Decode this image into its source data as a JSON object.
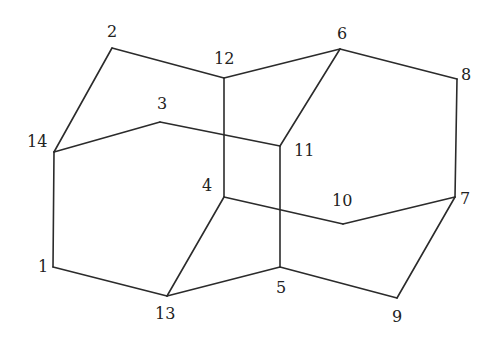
{
  "diagram": {
    "type": "graph",
    "directed": false,
    "colors": {
      "background": "#ffffff",
      "edge": "#2b2b2b",
      "label": "#222222"
    },
    "vertices": [
      {
        "id": "1",
        "label": "1",
        "x": 53,
        "y": 267,
        "label_x": 38,
        "label_y": 272
      },
      {
        "id": "2",
        "label": "2",
        "x": 112,
        "y": 48,
        "label_x": 107,
        "label_y": 37
      },
      {
        "id": "3",
        "label": "3",
        "x": 160,
        "y": 122,
        "label_x": 157,
        "label_y": 109
      },
      {
        "id": "4",
        "label": "4",
        "x": 224,
        "y": 197,
        "label_x": 202,
        "label_y": 191
      },
      {
        "id": "5",
        "label": "5",
        "x": 280,
        "y": 267,
        "label_x": 276,
        "label_y": 293
      },
      {
        "id": "6",
        "label": "6",
        "x": 340,
        "y": 49,
        "label_x": 337,
        "label_y": 39
      },
      {
        "id": "7",
        "label": "7",
        "x": 455,
        "y": 197,
        "label_x": 460,
        "label_y": 204
      },
      {
        "id": "8",
        "label": "8",
        "x": 457,
        "y": 79,
        "label_x": 461,
        "label_y": 80
      },
      {
        "id": "9",
        "label": "9",
        "x": 397,
        "y": 298,
        "label_x": 392,
        "label_y": 322
      },
      {
        "id": "10",
        "label": "10",
        "x": 343,
        "y": 224,
        "label_x": 332,
        "label_y": 206
      },
      {
        "id": "11",
        "label": "11",
        "x": 280,
        "y": 146,
        "label_x": 294,
        "label_y": 156
      },
      {
        "id": "12",
        "label": "12",
        "x": 224,
        "y": 78,
        "label_x": 214,
        "label_y": 64
      },
      {
        "id": "13",
        "label": "13",
        "x": 167,
        "y": 296,
        "label_x": 155,
        "label_y": 319
      },
      {
        "id": "14",
        "label": "14",
        "x": 54,
        "y": 152,
        "label_x": 27,
        "label_y": 147
      }
    ],
    "edges": [
      [
        "2",
        "14"
      ],
      [
        "2",
        "12"
      ],
      [
        "12",
        "6"
      ],
      [
        "12",
        "4"
      ],
      [
        "14",
        "3"
      ],
      [
        "3",
        "11"
      ],
      [
        "14",
        "1"
      ],
      [
        "1",
        "13"
      ],
      [
        "13",
        "4"
      ],
      [
        "13",
        "5"
      ],
      [
        "4",
        "10"
      ],
      [
        "10",
        "7"
      ],
      [
        "6",
        "11"
      ],
      [
        "6",
        "8"
      ],
      [
        "8",
        "7"
      ],
      [
        "7",
        "9"
      ],
      [
        "9",
        "5"
      ],
      [
        "11",
        "5"
      ]
    ]
  }
}
